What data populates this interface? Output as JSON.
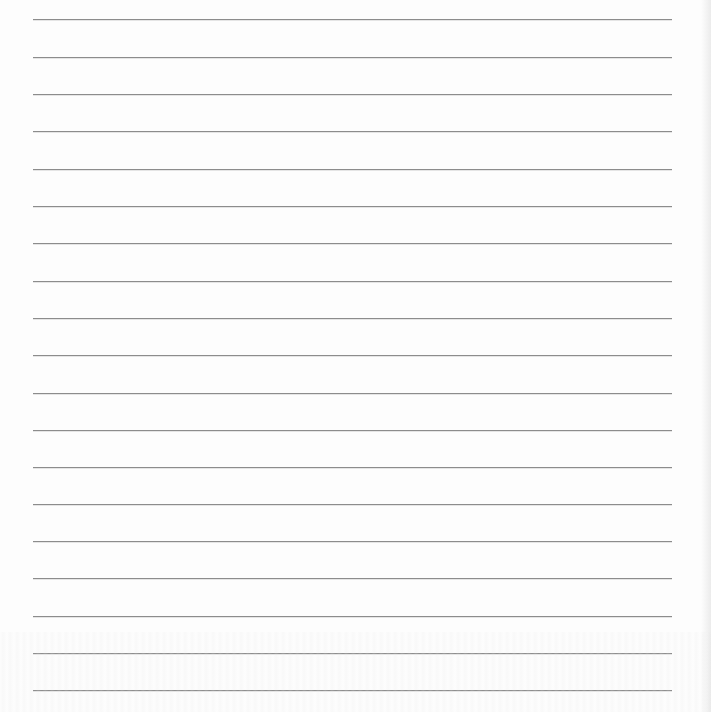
{
  "page": {
    "type": "lined-paper",
    "background_color": "#fdfdfd",
    "rule_color": "#8c8c8c",
    "rule_thickness_px": 1,
    "rule_left_px": 33,
    "rule_right_px": 672,
    "rule_positions_y": [
      19,
      57,
      94,
      131,
      169,
      206,
      243,
      281,
      318,
      355,
      393,
      430,
      467,
      504,
      541,
      578,
      616,
      653,
      690
    ],
    "rule_count": 19,
    "text_content": []
  }
}
